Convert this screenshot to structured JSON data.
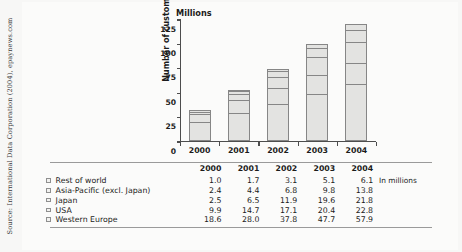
{
  "source_credit": "Source: International Data Corporation (2004), epaynews.com",
  "chart_data": {
    "type": "bar",
    "subtype": "stacked-bar",
    "title": "",
    "unit_heading": "Millions",
    "ylabel": "Number of customers",
    "xlabel": "",
    "categories": [
      "2000",
      "2001",
      "2002",
      "2003",
      "2004"
    ],
    "ylim": [
      0,
      125
    ],
    "yticks": [
      0,
      25,
      50,
      75,
      100,
      125
    ],
    "ytick_labels": [
      "0",
      "25",
      "50",
      "75",
      "100",
      "125"
    ],
    "grid": false,
    "legend_position": "below-table-left",
    "stack_order_bottom_to_top": [
      "Western Europe",
      "USA",
      "Japan",
      "Asia-Pacific (excl. Japan)",
      "Rest of world"
    ],
    "series": [
      {
        "name": "Rest of world",
        "values": [
          1.0,
          1.7,
          3.1,
          5.1,
          6.1
        ]
      },
      {
        "name": "Asia-Pacific (excl. Japan)",
        "values": [
          2.4,
          4.4,
          6.8,
          9.8,
          13.8
        ]
      },
      {
        "name": "Japan",
        "values": [
          2.5,
          6.5,
          11.9,
          19.6,
          21.8
        ]
      },
      {
        "name": "USA",
        "values": [
          9.9,
          14.7,
          17.1,
          20.4,
          22.8
        ]
      },
      {
        "name": "Western Europe",
        "values": [
          18.6,
          28.0,
          37.8,
          47.7,
          57.9
        ]
      }
    ],
    "totals": [
      34.4,
      55.3,
      76.7,
      102.6,
      122.4
    ],
    "bar_fill_color": "#e3e3e1",
    "bar_border_color": "#868686"
  },
  "table": {
    "note": "In millions",
    "year_headers": [
      "2000",
      "2001",
      "2002",
      "2003",
      "2004"
    ],
    "rows": [
      {
        "label": "Rest of world",
        "values": [
          "1.0",
          "1.7",
          "3.1",
          "5.1",
          "6.1"
        ]
      },
      {
        "label": "Asia-Pacific (excl. Japan)",
        "values": [
          "2.4",
          "4.4",
          "6.8",
          "9.8",
          "13.8"
        ]
      },
      {
        "label": "Japan",
        "values": [
          "2.5",
          "6.5",
          "11.9",
          "19.6",
          "21.8"
        ]
      },
      {
        "label": "USA",
        "values": [
          "9.9",
          "14.7",
          "17.1",
          "20.4",
          "22.8"
        ]
      },
      {
        "label": "Western Europe",
        "values": [
          "18.6",
          "28.0",
          "37.8",
          "47.7",
          "57.9"
        ]
      }
    ]
  }
}
